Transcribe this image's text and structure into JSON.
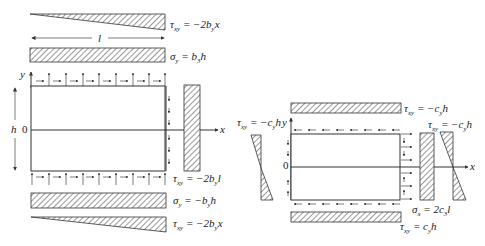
{
  "left_diagram": {
    "axis_x": "x",
    "axis_y": "y",
    "origin": "0",
    "dim_length": "l",
    "dim_height": "h",
    "labels": {
      "top_shear": {
        "sym": "τ",
        "sub": "xy",
        "rhs": " = −2b",
        "rsub": "y",
        "tail": "x"
      },
      "top_normal": {
        "sym": "σ",
        "sub": "y",
        "rhs": " = b",
        "rsub": "3",
        "tail": "h"
      },
      "right_shear": {
        "sym": "τ",
        "sub": "xy",
        "rhs": " = −2b",
        "rsub": "y",
        "tail": "l"
      },
      "bottom_normal": {
        "sym": "σ",
        "sub": "y",
        "rhs": " = −b",
        "rsub": "y",
        "tail": "h"
      },
      "bottom_shear": {
        "sym": "τ",
        "sub": "xy",
        "rhs": " = −2b",
        "rsub": "y",
        "tail": "x"
      }
    }
  },
  "right_diagram": {
    "axis_x": "x",
    "axis_y": "y",
    "origin": "0",
    "labels": {
      "top_shear": {
        "sym": "τ",
        "sub": "xy",
        "rhs": " = −c",
        "rsub": "y",
        "tail": "h"
      },
      "left_shear": {
        "sym": "τ",
        "sub": "xy",
        "rhs": " = −c",
        "rsub": "y",
        "tail": "h"
      },
      "right_shear": {
        "sym": "τ",
        "sub": "xy",
        "rhs": " = −c",
        "rsub": "y",
        "tail": "h"
      },
      "right_normal": {
        "sym": "σ",
        "sub": "x",
        "rhs": " = 2c",
        "rsub": "3",
        "tail": "l"
      },
      "bottom_shear": {
        "sym": "τ",
        "sub": "xy",
        "rhs": " = c",
        "rsub": "y",
        "tail": "h"
      }
    }
  },
  "colors": {
    "ink": "#333333",
    "background": "#ffffff"
  }
}
